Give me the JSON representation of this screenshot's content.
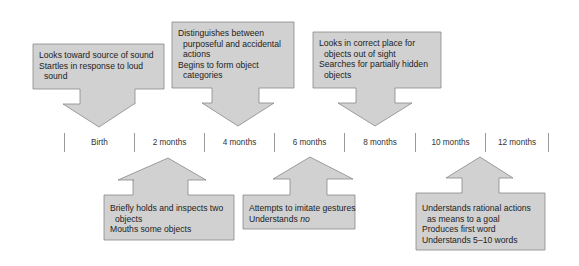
{
  "colors": {
    "box_fill": "#d1d1d1",
    "box_stroke": "#888888",
    "divider": "#999999",
    "text": "#222222"
  },
  "timeline": {
    "labels": [
      "Birth",
      "2 months",
      "4 months",
      "6 months",
      "8 months",
      "10 months",
      "12 months"
    ]
  },
  "top_callouts": [
    {
      "anchor": "Birth",
      "lines": [
        "Looks toward source of sound",
        "Startles in response to loud",
        "sound"
      ]
    },
    {
      "anchor": "4 months",
      "lines": [
        "Distinguishes between",
        "purposeful and accidental",
        "actions",
        "Begins to form object",
        "categories"
      ]
    },
    {
      "anchor": "8 months",
      "lines": [
        "Looks in correct place for",
        "objects out of sight",
        "Searches for partially hidden",
        "objects"
      ]
    }
  ],
  "bottom_callouts": [
    {
      "anchor": "2 months",
      "lines": [
        "Briefly holds and inspects two",
        "objects",
        "Mouths some objects"
      ]
    },
    {
      "anchor": "6 months",
      "lines": [
        "Attempts to imitate gestures",
        "Understands "
      ],
      "emphasis": "no"
    },
    {
      "anchor": "12 months",
      "lines": [
        "Understands rational actions",
        "as means to a goal",
        "Produces first word",
        "Understands 5–10 words"
      ]
    }
  ]
}
